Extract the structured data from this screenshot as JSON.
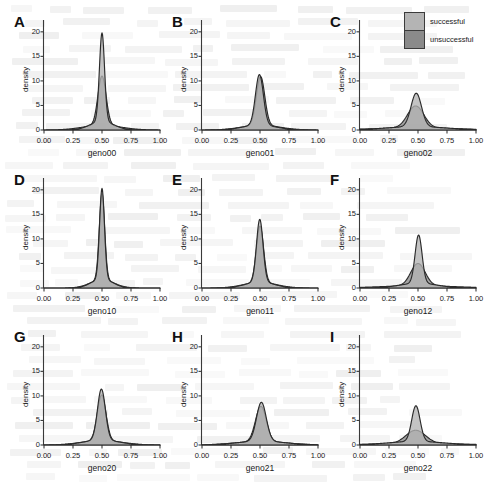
{
  "figure": {
    "kind": "density-plot-grid",
    "rows": 3,
    "cols": 3,
    "background_note": "faint bleed-through text from reverse page of scan (illegible)"
  },
  "legend": {
    "position": "top-right",
    "entries": [
      {
        "label": "successful",
        "color": "#b4b4b4",
        "border": "#3b3b3b"
      },
      {
        "label": "unsuccessful",
        "color": "#8a8a8a",
        "border": "#3b3b3b"
      }
    ]
  },
  "axes": {
    "ylabel": "density",
    "yticks": [
      "0",
      "5",
      "10",
      "15",
      "20"
    ],
    "ytick_values": [
      0,
      5,
      10,
      15,
      20
    ],
    "xticks": [
      "0.00",
      "0.25",
      "0.50",
      "0.75",
      "1.00"
    ],
    "xtick_values": [
      0.0,
      0.25,
      0.5,
      0.75,
      1.0
    ],
    "xlim": [
      0.0,
      1.0
    ],
    "ylim": [
      0,
      22
    ],
    "grid": false
  },
  "colors": {
    "successful_fill": "#b4b4b4",
    "unsuccessful_fill": "#8a8a8a",
    "curve_stroke": "#2b2b2b",
    "axis": "#3a3a3a",
    "text": "#1a1a1a"
  },
  "chart_data": [
    {
      "type": "area",
      "panel": "A",
      "title": "A",
      "xlabel": "geno00",
      "ylabel": "density",
      "xlim": [
        0.0,
        1.0
      ],
      "ylim": [
        0,
        22
      ],
      "series": [
        {
          "name": "successful",
          "peak_x": 0.5,
          "peak_y": 19.8,
          "sigma": 0.022,
          "tail": 0.1
        },
        {
          "name": "unsuccessful",
          "peak_x": 0.5,
          "peak_y": 11.0,
          "sigma": 0.035,
          "tail": 0.16
        }
      ]
    },
    {
      "type": "area",
      "panel": "B",
      "title": "B",
      "xlabel": "geno01",
      "ylabel": "density",
      "xlim": [
        0.0,
        1.0
      ],
      "ylim": [
        0,
        22
      ],
      "series": [
        {
          "name": "successful",
          "peak_x": 0.495,
          "peak_y": 11.3,
          "sigma": 0.034,
          "tail": 0.14
        },
        {
          "name": "unsuccessful",
          "peak_x": 0.505,
          "peak_y": 10.9,
          "sigma": 0.036,
          "tail": 0.16
        }
      ]
    },
    {
      "type": "area",
      "panel": "C",
      "title": "C",
      "xlabel": "geno02",
      "ylabel": "density",
      "xlim": [
        0.0,
        1.0
      ],
      "ylim": [
        0,
        22
      ],
      "series": [
        {
          "name": "successful",
          "peak_x": 0.485,
          "peak_y": 7.5,
          "sigma": 0.045,
          "tail": 0.26
        },
        {
          "name": "unsuccessful",
          "peak_x": 0.48,
          "peak_y": 4.9,
          "sigma": 0.07,
          "tail": 0.34
        }
      ]
    },
    {
      "type": "area",
      "panel": "D",
      "title": "D",
      "xlabel": "geno10",
      "ylabel": "density",
      "xlim": [
        0.0,
        1.0
      ],
      "ylim": [
        0,
        22
      ],
      "series": [
        {
          "name": "successful",
          "peak_x": 0.5,
          "peak_y": 20.3,
          "sigma": 0.021,
          "tail": 0.09
        },
        {
          "name": "unsuccessful",
          "peak_x": 0.5,
          "peak_y": 19.2,
          "sigma": 0.023,
          "tail": 0.1
        }
      ]
    },
    {
      "type": "area",
      "panel": "E",
      "title": "E",
      "xlabel": "geno11",
      "ylabel": "density",
      "xlim": [
        0.0,
        1.0
      ],
      "ylim": [
        0,
        22
      ],
      "series": [
        {
          "name": "successful",
          "peak_x": 0.498,
          "peak_y": 14.0,
          "sigma": 0.028,
          "tail": 0.12
        },
        {
          "name": "unsuccessful",
          "peak_x": 0.5,
          "peak_y": 12.6,
          "sigma": 0.031,
          "tail": 0.14
        }
      ]
    },
    {
      "type": "area",
      "panel": "F",
      "title": "F",
      "xlabel": "geno12",
      "ylabel": "density",
      "xlim": [
        0.0,
        1.0
      ],
      "ylim": [
        0,
        22
      ],
      "series": [
        {
          "name": "successful",
          "peak_x": 0.505,
          "peak_y": 10.8,
          "sigma": 0.03,
          "tail": 0.16
        },
        {
          "name": "unsuccessful",
          "peak_x": 0.5,
          "peak_y": 5.0,
          "sigma": 0.062,
          "tail": 0.32
        }
      ]
    },
    {
      "type": "area",
      "panel": "G",
      "title": "G",
      "xlabel": "geno20",
      "ylabel": "density",
      "xlim": [
        0.0,
        1.0
      ],
      "ylim": [
        0,
        22
      ],
      "series": [
        {
          "name": "successful",
          "peak_x": 0.495,
          "peak_y": 11.4,
          "sigma": 0.034,
          "tail": 0.15
        },
        {
          "name": "unsuccessful",
          "peak_x": 0.497,
          "peak_y": 10.2,
          "sigma": 0.037,
          "tail": 0.17
        }
      ]
    },
    {
      "type": "area",
      "panel": "H",
      "title": "H",
      "xlabel": "geno21",
      "ylabel": "density",
      "xlim": [
        0.0,
        1.0
      ],
      "ylim": [
        0,
        22
      ],
      "series": [
        {
          "name": "successful",
          "peak_x": 0.512,
          "peak_y": 8.7,
          "sigma": 0.042,
          "tail": 0.2
        },
        {
          "name": "unsuccessful",
          "peak_x": 0.508,
          "peak_y": 7.9,
          "sigma": 0.046,
          "tail": 0.22
        }
      ]
    },
    {
      "type": "area",
      "panel": "I",
      "title": "I",
      "xlabel": "geno22",
      "ylabel": "density",
      "xlim": [
        0.0,
        1.0
      ],
      "ylim": [
        0,
        22
      ],
      "series": [
        {
          "name": "successful",
          "peak_x": 0.482,
          "peak_y": 8.0,
          "sigma": 0.036,
          "tail": 0.24
        },
        {
          "name": "unsuccessful",
          "peak_x": 0.48,
          "peak_y": 3.0,
          "sigma": 0.085,
          "tail": 0.4
        }
      ]
    }
  ]
}
